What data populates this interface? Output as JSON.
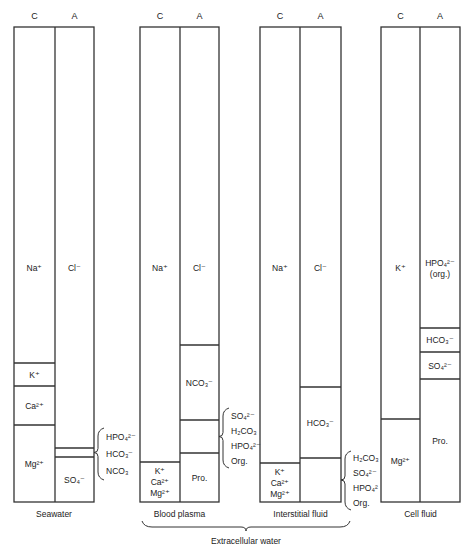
{
  "figure": {
    "column_headers": {
      "cation": "C",
      "anion": "A"
    },
    "top_y": 27,
    "bottom_y": 502,
    "group_brace": {
      "label": "Extracellular water",
      "from_x": 142,
      "to_x": 350
    },
    "columns": [
      {
        "name": "Seawater",
        "x_left": 14,
        "x_mid": 55,
        "x_right": 94,
        "cations": [
          {
            "label": "Na⁺",
            "from": 27,
            "to": 363
          },
          {
            "label": "K⁺",
            "from": 363,
            "to": 386
          },
          {
            "label": "Ca²⁺",
            "from": 386,
            "to": 425
          },
          {
            "label": "Mg²⁺",
            "from": 425,
            "to": 502
          }
        ],
        "anions": [
          {
            "label": "Cl⁻",
            "from": 27,
            "to": 448
          },
          {
            "label": "",
            "from": 448,
            "to": 457
          },
          {
            "label": "SO₄⁻",
            "from": 457,
            "to": 502
          }
        ],
        "side_brace": {
          "x": 98,
          "from": 448,
          "to": 457,
          "span_top": 428,
          "span_bottom": 480,
          "items": [
            "HPO₄²⁻",
            "HCO₃⁻",
            "NCO₃"
          ]
        }
      },
      {
        "name": "Blood plasma",
        "x_left": 140,
        "x_mid": 180,
        "x_right": 219,
        "cations": [
          {
            "label": "Na⁺",
            "from": 27,
            "to": 462
          },
          {
            "label": "K⁺|Ca²⁺|Mg²⁺",
            "from": 462,
            "to": 502
          }
        ],
        "anions": [
          {
            "label": "Cl⁻",
            "from": 27,
            "to": 345
          },
          {
            "label": "NCO₃⁻",
            "from": 345,
            "to": 420
          },
          {
            "label": "",
            "from": 420,
            "to": 453
          },
          {
            "label": "Pro.",
            "from": 453,
            "to": 502
          }
        ],
        "side_brace": {
          "x": 223,
          "from": 420,
          "to": 453,
          "span_top": 408,
          "span_bottom": 468,
          "items": [
            "SO₄²⁻",
            "H₂CO₃",
            "HPO₄²⁻",
            "Org."
          ]
        }
      },
      {
        "name": "Interstitial fluid",
        "x_left": 260,
        "x_mid": 300,
        "x_right": 341,
        "cations": [
          {
            "label": "Na⁺",
            "from": 27,
            "to": 463
          },
          {
            "label": "K⁺|Ca²⁺|Mg²⁺",
            "from": 463,
            "to": 502
          }
        ],
        "anions": [
          {
            "label": "Cl⁻",
            "from": 27,
            "to": 387
          },
          {
            "label": "HCO₃⁻",
            "from": 387,
            "to": 458
          },
          {
            "label": "",
            "from": 458,
            "to": 502
          }
        ],
        "side_brace": {
          "x": 345,
          "from": 458,
          "to": 502,
          "span_top": 451,
          "span_bottom": 510,
          "items": [
            "H₂CO₃",
            "SO₄²⁻",
            "HPO₄²",
            "Org."
          ]
        }
      },
      {
        "name": "Cell fluid",
        "x_left": 381,
        "x_mid": 420,
        "x_right": 460,
        "cations": [
          {
            "label": "K⁺",
            "from": 27,
            "to": 419
          },
          {
            "label": "Mg²⁺",
            "from": 419,
            "to": 502
          }
        ],
        "anions": [
          {
            "label": "HPO₄²⁻|(org.)",
            "from": 27,
            "to": 328
          },
          {
            "label": "HCO₃⁻",
            "from": 328,
            "to": 352
          },
          {
            "label": "SO₄²⁻",
            "from": 352,
            "to": 379
          },
          {
            "label": "Pro.",
            "from": 379,
            "to": 502
          }
        ],
        "side_brace": null
      }
    ]
  }
}
